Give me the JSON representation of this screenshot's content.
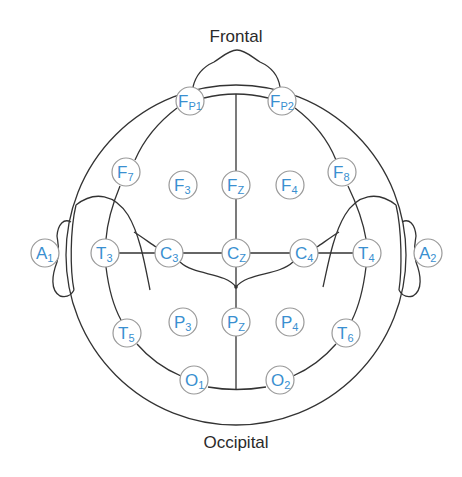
{
  "diagram": {
    "title_top": "Frontal",
    "title_bottom": "Occipital",
    "colors": {
      "outline": "#333333",
      "electrode_text": "#3a8fd0",
      "electrode_border": "#999999",
      "background": "#ffffff"
    },
    "electrodes": [
      {
        "id": "FP1",
        "main": "F",
        "sub": "P1",
        "x": 190,
        "y": 101
      },
      {
        "id": "FP2",
        "main": "F",
        "sub": "P2",
        "x": 282,
        "y": 101
      },
      {
        "id": "F7",
        "main": "F",
        "sub": "7",
        "x": 126,
        "y": 172
      },
      {
        "id": "F3",
        "main": "F",
        "sub": "3",
        "x": 183,
        "y": 185
      },
      {
        "id": "Fz",
        "main": "F",
        "sub": "Z",
        "x": 236,
        "y": 185
      },
      {
        "id": "F4",
        "main": "F",
        "sub": "4",
        "x": 290,
        "y": 185
      },
      {
        "id": "F8",
        "main": "F",
        "sub": "8",
        "x": 342,
        "y": 172
      },
      {
        "id": "A1",
        "main": "A",
        "sub": "1",
        "x": 45,
        "y": 253
      },
      {
        "id": "T3",
        "main": "T",
        "sub": "3",
        "x": 105,
        "y": 253
      },
      {
        "id": "C3",
        "main": "C",
        "sub": "3",
        "x": 169,
        "y": 253
      },
      {
        "id": "Cz",
        "main": "C",
        "sub": "Z",
        "x": 236,
        "y": 253
      },
      {
        "id": "C4",
        "main": "C",
        "sub": "4",
        "x": 304,
        "y": 253
      },
      {
        "id": "T4",
        "main": "T",
        "sub": "4",
        "x": 367,
        "y": 253
      },
      {
        "id": "A2",
        "main": "A",
        "sub": "2",
        "x": 428,
        "y": 253
      },
      {
        "id": "T5",
        "main": "T",
        "sub": "5",
        "x": 127,
        "y": 333
      },
      {
        "id": "P3",
        "main": "P",
        "sub": "3",
        "x": 183,
        "y": 322
      },
      {
        "id": "Pz",
        "main": "P",
        "sub": "Z",
        "x": 236,
        "y": 322
      },
      {
        "id": "P4",
        "main": "P",
        "sub": "4",
        "x": 290,
        "y": 322
      },
      {
        "id": "T6",
        "main": "T",
        "sub": "6",
        "x": 346,
        "y": 333
      },
      {
        "id": "O1",
        "main": "O",
        "sub": "1",
        "x": 194,
        "y": 380
      },
      {
        "id": "O2",
        "main": "O",
        "sub": "2",
        "x": 280,
        "y": 380
      }
    ]
  }
}
